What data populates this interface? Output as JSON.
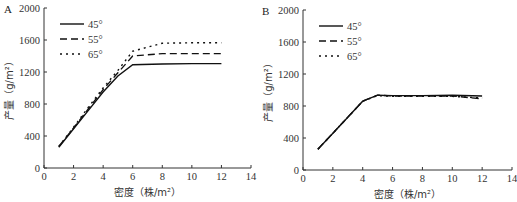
{
  "chart_data": [
    {
      "type": "line",
      "panel": "A",
      "title": "",
      "xlabel": "密度（株/m²）",
      "ylabel": "产量（g/m²）",
      "xlim": [
        0,
        14
      ],
      "ylim": [
        0,
        2000
      ],
      "xticks": [
        "0",
        "2",
        "4",
        "6",
        "8",
        "10",
        "12",
        "14"
      ],
      "yticks": [
        "0",
        "400",
        "800",
        "1200",
        "1600",
        "2000"
      ],
      "grid": false,
      "legend_position": "upper-left",
      "series": [
        {
          "name": "45°",
          "style": "solid",
          "x": [
            1,
            2,
            3,
            4,
            5,
            6,
            8,
            10,
            12
          ],
          "y": [
            260,
            490,
            720,
            950,
            1150,
            1290,
            1300,
            1305,
            1305
          ]
        },
        {
          "name": "55°",
          "style": "dashed",
          "x": [
            1,
            2,
            3,
            4,
            5,
            6,
            8,
            10,
            12
          ],
          "y": [
            270,
            500,
            740,
            980,
            1190,
            1400,
            1430,
            1430,
            1430
          ]
        },
        {
          "name": "65°",
          "style": "dotted",
          "x": [
            1,
            2,
            3,
            4,
            5,
            6,
            8,
            10,
            12
          ],
          "y": [
            270,
            510,
            760,
            1000,
            1220,
            1460,
            1560,
            1565,
            1565
          ]
        }
      ]
    },
    {
      "type": "line",
      "panel": "B",
      "title": "",
      "xlabel": "密度（株/m²）",
      "ylabel": "产量（g/m²）",
      "xlim": [
        0,
        14
      ],
      "ylim": [
        0,
        2000
      ],
      "xticks": [
        "0",
        "2",
        "4",
        "6",
        "8",
        "10",
        "12",
        "14"
      ],
      "yticks": [
        "0",
        "400",
        "800",
        "1200",
        "1600",
        "2000"
      ],
      "grid": false,
      "legend_position": "upper-left",
      "series": [
        {
          "name": "45°",
          "style": "solid",
          "x": [
            1,
            2,
            3,
            4,
            5,
            6,
            8,
            10,
            12
          ],
          "y": [
            260,
            460,
            660,
            860,
            935,
            930,
            930,
            935,
            925
          ]
        },
        {
          "name": "55°",
          "style": "dashed",
          "x": [
            1,
            2,
            3,
            4,
            5,
            6,
            8,
            10,
            12
          ],
          "y": [
            260,
            460,
            660,
            860,
            935,
            925,
            925,
            925,
            890
          ]
        },
        {
          "name": "65°",
          "style": "dotted",
          "x": [
            1,
            2,
            3,
            4,
            5,
            6,
            8,
            10,
            12
          ],
          "y": [
            260,
            460,
            660,
            860,
            930,
            920,
            920,
            920,
            900
          ]
        }
      ]
    }
  ]
}
